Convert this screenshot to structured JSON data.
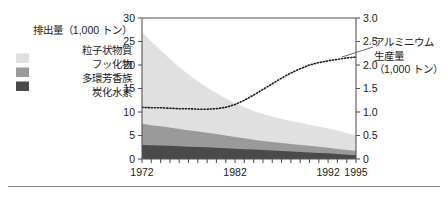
{
  "legend": {
    "title": "排出量（1,000 トン）",
    "items": [
      {
        "label": "粒子状物質",
        "label2": "",
        "color": "#e0e0e0",
        "name": "particulates"
      },
      {
        "label": "フッ化物",
        "label2": "",
        "color": "#9a9a9a",
        "name": "fluorides"
      },
      {
        "label": "多環芳香族",
        "label2": "炭化水素",
        "color": "#4a4a4a",
        "name": "polycyclic-aromatic-hydrocarbons"
      }
    ]
  },
  "right_axis_title": {
    "line1": "アルミニウム",
    "line2": "生産量",
    "line3": "（1,000 トン）"
  },
  "colors": {
    "particulates": "#e0e0e0",
    "fluorides": "#9a9a9a",
    "pah": "#4a4a4a",
    "axis": "#555555",
    "dotted_line": "#1a1a1a",
    "rule": "#8a8a8a"
  },
  "chart_data": {
    "type": "area",
    "title": "",
    "subtitle": "",
    "xlabel": "",
    "ylabel": "排出量（1,000 トン）",
    "y2label": "アルミニウム生産量（1,000 トン）",
    "grid": false,
    "legend_position": "left",
    "x": [
      1972,
      1973,
      1974,
      1975,
      1976,
      1977,
      1978,
      1979,
      1980,
      1981,
      1982,
      1983,
      1984,
      1985,
      1986,
      1987,
      1988,
      1989,
      1990,
      1991,
      1992,
      1993,
      1994,
      1995
    ],
    "xlim": [
      1972,
      1995
    ],
    "xticks_labeled": [
      "1972",
      "1982",
      "1992",
      "1995"
    ],
    "xticks_labeled_values": [
      1972,
      1982,
      1992,
      1995
    ],
    "ylim": [
      0,
      30
    ],
    "yticks": [
      0,
      5,
      10,
      15,
      20,
      25,
      30
    ],
    "y2lim": [
      0,
      3.0
    ],
    "y2ticks": [
      "0",
      "0.5",
      "1.0",
      "1.5",
      "2.0",
      "2.5",
      "3.0"
    ],
    "y2ticks_values": [
      0,
      0.5,
      1.0,
      1.5,
      2.0,
      2.5,
      3.0
    ],
    "stacked": true,
    "series": [
      {
        "name": "多環芳香族炭化水素",
        "axis": "left",
        "color": "#4a4a4a",
        "values": [
          3.0,
          2.9,
          2.85,
          2.8,
          2.7,
          2.6,
          2.55,
          2.5,
          2.4,
          2.3,
          2.2,
          2.1,
          2.0,
          1.9,
          1.8,
          1.7,
          1.6,
          1.5,
          1.4,
          1.3,
          1.2,
          1.05,
          0.9,
          0.8
        ]
      },
      {
        "name": "フッ化物",
        "axis": "left",
        "color": "#9a9a9a",
        "values": [
          4.5,
          4.3,
          4.1,
          3.9,
          3.7,
          3.5,
          3.3,
          3.1,
          2.9,
          2.7,
          2.5,
          2.3,
          2.1,
          1.95,
          1.8,
          1.7,
          1.6,
          1.5,
          1.4,
          1.3,
          1.2,
          1.1,
          1.0,
          0.95
        ]
      },
      {
        "name": "粒子状物質",
        "axis": "left",
        "color": "#e0e0e0",
        "values": [
          19.5,
          17.8,
          16.2,
          14.6,
          13.2,
          11.9,
          10.7,
          9.6,
          8.7,
          7.9,
          7.2,
          6.6,
          6.1,
          5.7,
          5.4,
          5.1,
          4.9,
          4.7,
          4.5,
          4.3,
          4.1,
          3.9,
          3.6,
          3.3
        ]
      }
    ],
    "line_series": {
      "name": "アルミニウム生産量",
      "axis": "right",
      "style": "dotted",
      "color": "#1a1a1a",
      "values": [
        1.1,
        1.09,
        1.09,
        1.08,
        1.07,
        1.07,
        1.06,
        1.06,
        1.07,
        1.1,
        1.16,
        1.25,
        1.36,
        1.48,
        1.6,
        1.72,
        1.83,
        1.92,
        2.0,
        2.05,
        2.09,
        2.12,
        2.15,
        2.17
      ]
    }
  }
}
